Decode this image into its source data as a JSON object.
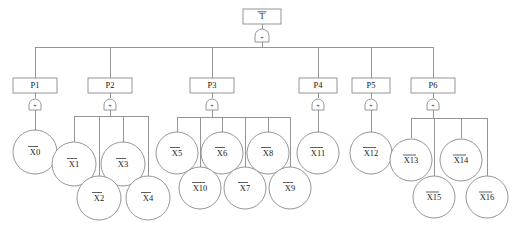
{
  "diagram": {
    "type": "fault-tree",
    "title_visible": false,
    "colors": {
      "background": "#ffffff",
      "stroke": "#8a8a8a",
      "text": "#1a1a1a"
    },
    "root": {
      "id": "top-event",
      "label": "T",
      "overbar": true,
      "shape": "rectangle",
      "gate": {
        "symbol": "+",
        "type": "or-gate"
      }
    },
    "intermediate_nodes": [
      {
        "id": "P1",
        "label": "P1",
        "gate": {
          "symbol": "+",
          "type": "or-gate"
        },
        "children": [
          "X0"
        ]
      },
      {
        "id": "P2",
        "label": "P2",
        "gate": {
          "symbol": "+",
          "type": "or-gate"
        },
        "children": [
          "X1",
          "X2",
          "X3",
          "X4"
        ]
      },
      {
        "id": "P3",
        "label": "P3",
        "gate": {
          "symbol": "+",
          "type": "or-gate"
        },
        "children": [
          "X5",
          "X10",
          "X6",
          "X7",
          "X8",
          "X9"
        ]
      },
      {
        "id": "P4",
        "label": "P4",
        "gate": {
          "symbol": "+",
          "type": "or-gate"
        },
        "children": [
          "X11"
        ]
      },
      {
        "id": "P5",
        "label": "P5",
        "gate": {
          "symbol": "+",
          "type": "or-gate"
        },
        "children": [
          "X12"
        ]
      },
      {
        "id": "P6",
        "label": "P6",
        "gate": {
          "symbol": "+",
          "type": "or-gate"
        },
        "children": [
          "X13",
          "X15",
          "X14",
          "X16"
        ]
      }
    ],
    "basic_events": [
      {
        "id": "X0",
        "label": "X0",
        "overbar": true
      },
      {
        "id": "X1",
        "label": "X1",
        "overbar": true
      },
      {
        "id": "X2",
        "label": "X2",
        "overbar": true
      },
      {
        "id": "X3",
        "label": "X3",
        "overbar": true
      },
      {
        "id": "X4",
        "label": "X4",
        "overbar": true
      },
      {
        "id": "X5",
        "label": "X5",
        "overbar": true
      },
      {
        "id": "X6",
        "label": "X6",
        "overbar": true
      },
      {
        "id": "X7",
        "label": "X7",
        "overbar": true
      },
      {
        "id": "X8",
        "label": "X8",
        "overbar": true
      },
      {
        "id": "X9",
        "label": "X9",
        "overbar": true
      },
      {
        "id": "X10",
        "label": "X10",
        "overbar": true
      },
      {
        "id": "X11",
        "label": "X11",
        "overbar": true
      },
      {
        "id": "X12",
        "label": "X12",
        "overbar": true
      },
      {
        "id": "X13",
        "label": "X13",
        "overbar": true
      },
      {
        "id": "X14",
        "label": "X14",
        "overbar": true
      },
      {
        "id": "X15",
        "label": "X15",
        "overbar": true
      },
      {
        "id": "X16",
        "label": "X16",
        "overbar": true
      }
    ],
    "labels": {
      "root": "T",
      "p1": "P1",
      "p2": "P2",
      "p3": "P3",
      "p4": "P4",
      "p5": "P5",
      "p6": "P6",
      "gate_symbol": "+",
      "x0": "X0",
      "x1": "X1",
      "x2": "X2",
      "x3": "X3",
      "x4": "X4",
      "x5": "X5",
      "x6": "X6",
      "x7": "X7",
      "x8": "X8",
      "x9": "X9",
      "x10": "X10",
      "x11": "X11",
      "x12": "X12",
      "x13": "X13",
      "x14": "X14",
      "x15": "X15",
      "x16": "X16"
    }
  }
}
